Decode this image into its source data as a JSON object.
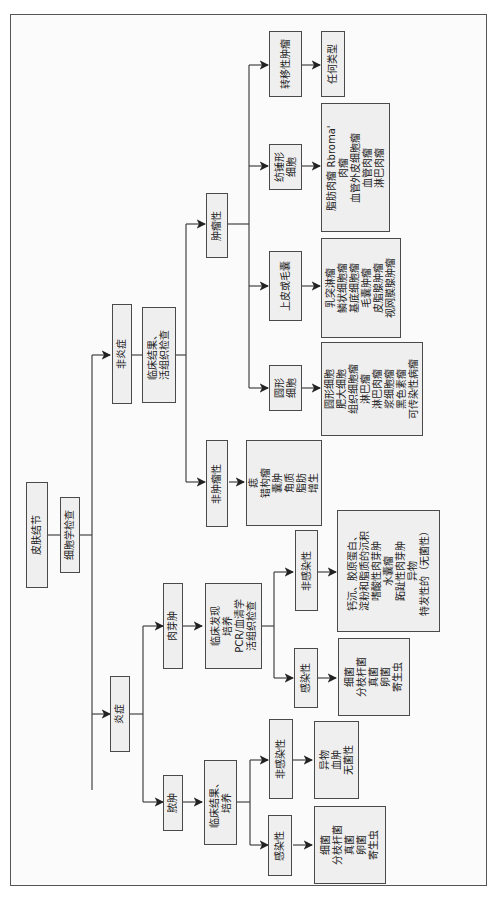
{
  "diagram": {
    "root": "皮肤结节",
    "cytology": "细胞学检查",
    "inflammatory": {
      "label": "炎症",
      "abscess": {
        "label": "脓肿",
        "test": [
          "临床结果、",
          "培养"
        ],
        "infectious": {
          "label": "感染性",
          "items": [
            "细菌",
            "分枝杆菌",
            "真菌",
            "卵菌",
            "寄生虫"
          ]
        },
        "noninfectious": {
          "label": "非感染性",
          "items": [
            "异物",
            "血肿",
            "无菌性"
          ]
        }
      },
      "granuloma": {
        "label": "肉芽肿",
        "test": [
          "临床发现",
          "培养",
          "PCR/血清学",
          "活组织检查"
        ],
        "infectious": {
          "label": "感染性",
          "items": [
            "细菌",
            "分枝杆菌",
            "真菌",
            "卵菌",
            "寄生虫"
          ]
        },
        "noninfectious": {
          "label": "非感染性",
          "items": [
            "钙沉、胶原蛋白、",
            "淀粉和脂质的沉积",
            "嗜酸性肉芽肿",
            "水囊瘤",
            "跖趾性肉芽肿",
            "异物",
            "特发性的（无菌性）"
          ]
        }
      }
    },
    "noninflammatory": {
      "label": "非炎症",
      "test": [
        "临床结果、",
        "活组织检查"
      ],
      "nonneoplastic": {
        "label": "非肿瘤性",
        "items": [
          "痣",
          "错构瘤",
          "囊肿",
          "角质",
          "脂肪",
          "增生"
        ]
      },
      "neoplastic": {
        "label": "肿瘤性",
        "round": {
          "label": [
            "圆形",
            "细胞"
          ],
          "items": [
            "圆形细胞",
            "肥大细胞",
            "组织细胞瘤",
            "淋巴瘤",
            "淋巴肉瘤",
            "浆细胞瘤",
            "黑色素瘤",
            "可传染性病瘤"
          ]
        },
        "epithelial": {
          "label": "上皮或毛囊",
          "items": [
            "乳突淋瘤",
            "鳞状细胞瘤",
            "基底细胞瘤",
            "毛囊肿瘤",
            "皮脂腺肿瘤",
            "视网膜腺肿瘤"
          ]
        },
        "spindle": {
          "label": [
            "纺锤形",
            "细胞"
          ],
          "items": [
            "脂肪肉瘤  Rbroma'",
            "肉瘤",
            "血管外皮细胞瘤",
            "血管肉瘤",
            "淋巴肉瘤"
          ]
        },
        "metastatic": {
          "label": "转移性肿瘤",
          "items": [
            "任何类型"
          ]
        }
      }
    }
  }
}
